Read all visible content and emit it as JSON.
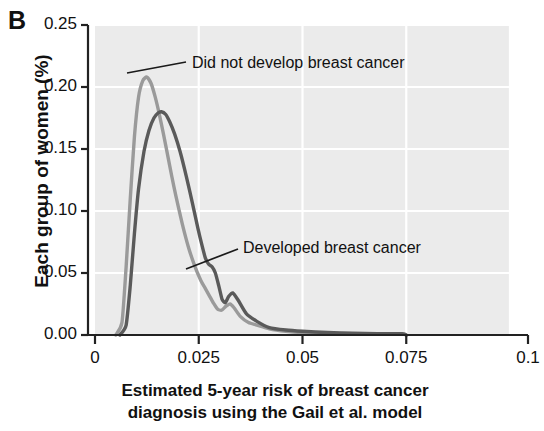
{
  "panel": {
    "label": "B"
  },
  "chart_data": {
    "type": "line",
    "title": "",
    "panel_label": "B",
    "xlabel": "Estimated 5-year risk of breast cancer diagnosis using the Gail et al. model",
    "xlabel_line1": "Estimated 5-year risk of breast cancer",
    "xlabel_line2": "diagnosis using the Gail et al. model",
    "ylabel": "Each group of women (%)",
    "xlim": [
      0,
      0.1
    ],
    "ylim": [
      0,
      0.25
    ],
    "xticks": [
      0,
      0.025,
      0.05,
      0.075,
      0.1
    ],
    "xtick_labels": [
      "0",
      "0.025",
      "0.05",
      "0.075",
      "0.1"
    ],
    "yticks": [
      0,
      0.05,
      0.1,
      0.15,
      0.2,
      0.25
    ],
    "ytick_labels": [
      "0.00",
      "0.05",
      "0.10",
      "0.15",
      "0.20",
      "0.25"
    ],
    "grid": true,
    "legend_position": "annotations",
    "plot_background": "#ebebeb",
    "gridline_color": "#ffffff",
    "series": [
      {
        "name": "Did not develop breast cancer",
        "color": "#9a9a9a",
        "annotation": "Did not develop breast cancer",
        "peak_x": 0.0125,
        "peak_y": 0.208,
        "x": [
          0.005,
          0.0065,
          0.0075,
          0.0085,
          0.0095,
          0.0105,
          0.0115,
          0.0125,
          0.0135,
          0.0145,
          0.0155,
          0.0165,
          0.0175,
          0.0185,
          0.0195,
          0.021,
          0.0225,
          0.024,
          0.0255,
          0.0265,
          0.0275,
          0.0285,
          0.0295,
          0.0305,
          0.0315,
          0.0325,
          0.0335,
          0.035,
          0.037,
          0.039,
          0.042,
          0.046,
          0.05,
          0.056,
          0.062,
          0.068,
          0.074,
          0.075
        ],
        "y": [
          0.0,
          0.01,
          0.055,
          0.11,
          0.16,
          0.192,
          0.205,
          0.208,
          0.203,
          0.192,
          0.178,
          0.162,
          0.145,
          0.128,
          0.112,
          0.09,
          0.071,
          0.056,
          0.044,
          0.038,
          0.032,
          0.026,
          0.021,
          0.02,
          0.023,
          0.025,
          0.022,
          0.015,
          0.01,
          0.008,
          0.005,
          0.003,
          0.002,
          0.0015,
          0.001,
          0.001,
          0.001,
          0.0
        ]
      },
      {
        "name": "Developed breast cancer",
        "color": "#5a5a5a",
        "annotation": "Developed breast cancer",
        "peak_x": 0.016,
        "peak_y": 0.18,
        "x": [
          0.006,
          0.0075,
          0.0085,
          0.0095,
          0.0105,
          0.0118,
          0.013,
          0.0142,
          0.0152,
          0.016,
          0.017,
          0.018,
          0.0192,
          0.0205,
          0.022,
          0.0235,
          0.0248,
          0.0258,
          0.0266,
          0.0274,
          0.0282,
          0.029,
          0.0298,
          0.0306,
          0.0314,
          0.0322,
          0.0332,
          0.0345,
          0.0365,
          0.039,
          0.042,
          0.046,
          0.05,
          0.056,
          0.062,
          0.068,
          0.074,
          0.075
        ],
        "y": [
          0.0,
          0.008,
          0.04,
          0.082,
          0.118,
          0.148,
          0.165,
          0.175,
          0.179,
          0.18,
          0.178,
          0.172,
          0.162,
          0.148,
          0.128,
          0.106,
          0.086,
          0.072,
          0.062,
          0.057,
          0.055,
          0.05,
          0.04,
          0.029,
          0.026,
          0.031,
          0.034,
          0.028,
          0.017,
          0.011,
          0.006,
          0.004,
          0.003,
          0.002,
          0.0015,
          0.001,
          0.001,
          0.0
        ]
      }
    ],
    "annotations": [
      {
        "text": "Did not develop breast cancer",
        "text_x_px": 192,
        "text_y_px": 54,
        "leader_from_px": [
          127,
          73
        ],
        "leader_to_px": [
          186,
          62
        ]
      },
      {
        "text": "Developed breast cancer",
        "text_x_px": 243,
        "text_y_px": 239,
        "leader_from_px": [
          186,
          269
        ],
        "leader_to_px": [
          238,
          249
        ]
      }
    ]
  }
}
